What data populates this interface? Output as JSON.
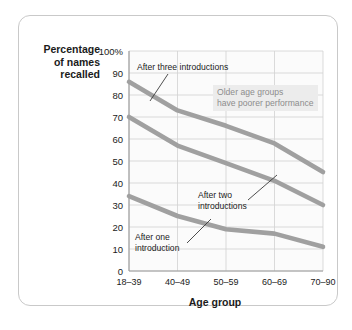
{
  "figure": {
    "frame_color": "#c9c9c9",
    "plot_bg": "#fbfbfb",
    "grid_color": "#d2d2d2",
    "line_color": "#a0a0a0",
    "note_bg": "#ececec",
    "note_text_color": "#8c8c8c"
  },
  "axis": {
    "ylabel_line1": "Percentage",
    "ylabel_line2": "of names",
    "ylabel_line3": "recalled",
    "xlabel": "Age group"
  },
  "annotations": {
    "three": "After three introductions",
    "two": "After two\nintroductions",
    "one": "After one\nintroduction",
    "note": "Older age groups\nhave poorer performance"
  },
  "chart_data": {
    "type": "line",
    "title": "",
    "xlabel": "Age group",
    "ylabel": "Percentage of names recalled",
    "categories": [
      "18–39",
      "40–49",
      "50–59",
      "60–69",
      "70–90"
    ],
    "ytick_labels": [
      "0",
      "10",
      "20",
      "30",
      "40",
      "50",
      "60",
      "70",
      "80",
      "90",
      "100%"
    ],
    "ytick_values": [
      0,
      10,
      20,
      30,
      40,
      50,
      60,
      70,
      80,
      90,
      100
    ],
    "ylim": [
      0,
      100
    ],
    "grid": true,
    "legend": "none (inline annotations)",
    "series": [
      {
        "name": "After three introductions",
        "values": [
          86,
          73,
          66,
          58,
          45
        ]
      },
      {
        "name": "After two introductions",
        "values": [
          70,
          57,
          49,
          41,
          30
        ]
      },
      {
        "name": "After one introduction",
        "values": [
          34,
          25,
          19,
          17,
          11
        ]
      }
    ]
  }
}
